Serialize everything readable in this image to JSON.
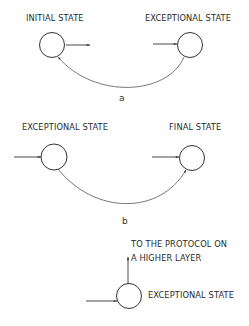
{
  "diagrams": [
    {
      "id": "a",
      "caption": "a",
      "states": [
        {
          "label": "INITIAL STATE"
        },
        {
          "label": "EXCEPTIONAL STATE"
        }
      ]
    },
    {
      "id": "b",
      "caption": "b",
      "states": [
        {
          "label": "EXCEPTIONAL STATE"
        },
        {
          "label": "FINAL STATE"
        }
      ]
    },
    {
      "id": "c",
      "states": [
        {
          "label": "EXCEPTIONAL STATE"
        }
      ],
      "annotation_line1": "TO THE PROTOCOL ON",
      "annotation_line2": "A HIGHER LAYER"
    }
  ],
  "colors": {
    "stroke": "#333333",
    "background": "#ffffff"
  }
}
